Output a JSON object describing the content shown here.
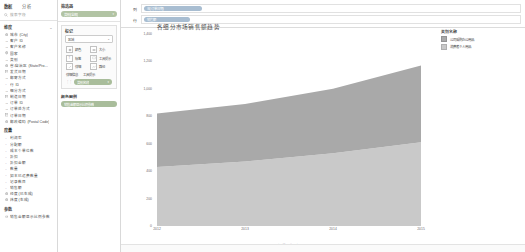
{
  "data_pane": {
    "tabs": [
      {
        "label": "数据",
        "active": true
      },
      {
        "label": "分析",
        "active": false
      }
    ],
    "search_placeholder": "搜索字段",
    "dimensions": {
      "header": "维度",
      "menu_glyph": "⌄",
      "items": [
        {
          "label": "城市 (City)",
          "icon": "globe-icon"
        },
        {
          "label": "客户 ID",
          "icon": "abc-icon"
        },
        {
          "label": "客户名称",
          "icon": "abc-icon"
        },
        {
          "label": "国家",
          "icon": "globe-icon"
        },
        {
          "label": "类别",
          "icon": "abc-icon"
        },
        {
          "label": "省/自治区 (State/Pro…",
          "icon": "globe-icon"
        },
        {
          "label": "发货日期",
          "icon": "calendar-icon"
        },
        {
          "label": "邮寄方式",
          "icon": "abc-icon"
        },
        {
          "label": "行 ID",
          "icon": "number-icon"
        },
        {
          "label": "细分方式",
          "icon": "abc-icon"
        },
        {
          "label": "制造日期",
          "icon": "calendar-icon"
        },
        {
          "label": "订单 ID",
          "icon": "abc-icon"
        },
        {
          "label": "订单处方式",
          "icon": "abc-icon"
        },
        {
          "label": "订单日期",
          "icon": "calendar-icon"
        },
        {
          "label": "邮政编码 (Postal Code)",
          "icon": "globe-icon"
        }
      ]
    },
    "measures": {
      "header": "度量",
      "items": [
        {
          "label": "利润率",
          "icon": "number-icon"
        },
        {
          "label": "分配额",
          "icon": "number-icon"
        },
        {
          "label": "成本个单位数",
          "icon": "number-icon"
        },
        {
          "label": "折扣",
          "icon": "number-icon"
        },
        {
          "label": "折扣金额",
          "icon": "number-icon"
        },
        {
          "label": "数量",
          "icon": "number-icon"
        },
        {
          "label": "如本已运费数量",
          "icon": "number-icon"
        },
        {
          "label": "记录数目",
          "icon": "number-icon"
        },
        {
          "label": "销售额",
          "icon": "number-icon"
        },
        {
          "label": "经度(已生成)",
          "icon": "globe-icon"
        },
        {
          "label": "纬度(生成)",
          "icon": "globe-icon"
        }
      ]
    },
    "parameters": {
      "header": "参数",
      "items": [
        {
          "label": "销售金额显示比例参数",
          "icon": "param-icon"
        }
      ]
    }
  },
  "mid_column": {
    "filters": {
      "header": "筛选器",
      "pill": {
        "label": "类别(全部)",
        "color": "#b2c4a4",
        "chevron": "▾"
      }
    },
    "marks": {
      "header": "标记",
      "mark_type": {
        "value": "区域",
        "chevron": "⌄"
      },
      "buttons": [
        {
          "label": "颜色",
          "icon": "color-icon"
        },
        {
          "label": "大小",
          "icon": "size-icon"
        },
        {
          "label": "标签",
          "icon": "label-icon"
        },
        {
          "label": "工具提示",
          "icon": "tooltip-icon"
        },
        {
          "label": "详细",
          "icon": "detail-icon"
        },
        {
          "label": "路径",
          "icon": "path-icon"
        }
      ],
      "detail_row": [
        "详细信息",
        "工具提示"
      ],
      "detail_pill": {
        "label": "类别名称",
        "color": "#a9bd9b",
        "chevron": "▾"
      }
    },
    "color_legend": {
      "header": "颜色图例",
      "pill": {
        "label": "销售金额显示比例参数",
        "color": "#a9bd9b"
      }
    }
  },
  "shelves": [
    {
      "name": "列",
      "pill": {
        "label": "年(订单日期)",
        "color": "#a8bdd1"
      }
    },
    {
      "name": "行",
      "pill": {
        "label": "销售额",
        "color": "#a8bdd1"
      }
    }
  ],
  "worksheet": {
    "title": "各细分市场销售额趋势"
  },
  "legend": {
    "title": "类别名称",
    "items": [
      {
        "label": "公司采购办公用品",
        "color": "#a9a9a9"
      },
      {
        "label": "消费者个人用品",
        "color": "#c9c9c9"
      }
    ]
  },
  "chart_data": {
    "type": "area",
    "title": "各细分市场销售额趋势",
    "xlabel": "订单日期 年",
    "ylabel": "",
    "categories": [
      "2012",
      "2013",
      "2014",
      "2015"
    ],
    "x": [
      2012,
      2013,
      2014,
      2015
    ],
    "ylim": [
      0,
      1400
    ],
    "yticks": [
      0,
      200,
      400,
      600,
      800,
      1000,
      1200,
      1400
    ],
    "ytick_labels": [
      "0",
      "200",
      "400",
      "600",
      "800",
      "1,000",
      "1,200",
      "1,400"
    ],
    "grid": false,
    "legend_position": "right",
    "stacked": true,
    "series": [
      {
        "name": "消费者个人用品",
        "color": "#c9c9c9",
        "values": [
          430,
          470,
          530,
          610
        ]
      },
      {
        "name": "公司采购办公用品",
        "color": "#a9a9a9",
        "values": [
          390,
          420,
          470,
          560
        ]
      }
    ]
  }
}
